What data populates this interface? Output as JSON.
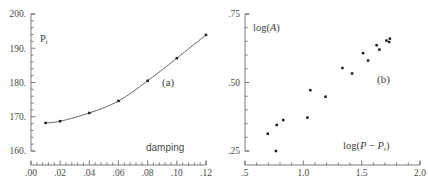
{
  "figure": {
    "background": "#ffffff",
    "ink": "#3a3a3a"
  },
  "chart_data": [
    {
      "type": "line",
      "panel_label": "(a)",
      "title": "",
      "xlabel": "damping",
      "ylabel": "P_t",
      "ylabel_html": "P<sub>t</sub>",
      "xlim": [
        0.0,
        0.12
      ],
      "ylim": [
        160,
        200
      ],
      "xticks": [
        0.0,
        0.02,
        0.04,
        0.06,
        0.08,
        0.1,
        0.12
      ],
      "xticklabels": [
        ".00",
        ".02",
        ".04",
        ".06",
        ".08",
        ".10",
        ".12"
      ],
      "yticks": [
        160,
        170,
        180,
        190,
        200
      ],
      "yticklabels": [
        "160.",
        "170.",
        "180.",
        "190.",
        "200."
      ],
      "x_minor_per_major": 5,
      "y_minor_per_major": 5,
      "grid": false,
      "legend": "none",
      "marker": "square",
      "marker_color": "#1d1d1d",
      "line_color": "#4c4c4c",
      "x": [
        0.01,
        0.02,
        0.04,
        0.06,
        0.08,
        0.1,
        0.12
      ],
      "y": [
        168.2,
        168.7,
        171.1,
        174.6,
        180.5,
        187.1,
        193.9
      ]
    },
    {
      "type": "scatter",
      "panel_label": "(b)",
      "title": "",
      "xlabel": "log(P - P_t)",
      "xlabel_html": "log(<i>P</i> &minus; <i>P</i><sub>t</sub>)",
      "ylabel": "log(A)",
      "ylabel_html": "log(<i>A</i>)",
      "xlim": [
        0.5,
        2.0
      ],
      "ylim": [
        0.25,
        0.75
      ],
      "xticks": [
        0.5,
        1.0,
        1.5,
        2.0
      ],
      "xticklabels": [
        ".5",
        "1.0",
        "1.5",
        "2.0"
      ],
      "yticks": [
        0.25,
        0.5,
        0.75
      ],
      "yticklabels": [
        ".25",
        ".50",
        ".75"
      ],
      "x_minor_per_major": 5,
      "y_minor_per_major": 5,
      "grid": false,
      "legend": "none",
      "marker": "square",
      "marker_color": "#1d1d1d",
      "points": [
        [
          0.695,
          0.313
        ],
        [
          0.765,
          0.25
        ],
        [
          0.772,
          0.345
        ],
        [
          0.828,
          0.363
        ],
        [
          1.035,
          0.372
        ],
        [
          1.06,
          0.472
        ],
        [
          1.19,
          0.448
        ],
        [
          1.335,
          0.553
        ],
        [
          1.418,
          0.533
        ],
        [
          1.512,
          0.607
        ],
        [
          1.555,
          0.58
        ],
        [
          1.628,
          0.636
        ],
        [
          1.652,
          0.62
        ],
        [
          1.712,
          0.653
        ],
        [
          1.735,
          0.648
        ],
        [
          1.742,
          0.66
        ]
      ]
    }
  ]
}
